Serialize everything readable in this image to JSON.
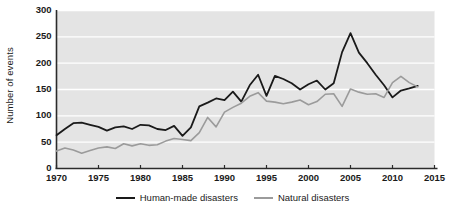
{
  "chart_data": {
    "type": "line",
    "title": "",
    "xlabel": "",
    "ylabel": "Number of events",
    "xlim": [
      1970,
      2015
    ],
    "ylim": [
      0,
      300
    ],
    "yticks": [
      0,
      50,
      100,
      150,
      200,
      250,
      300
    ],
    "xticks": [
      1970,
      1975,
      1980,
      1985,
      1990,
      1995,
      2000,
      2005,
      2010,
      2015
    ],
    "grid": "horizontal-white-on-gray",
    "legend_position": "below",
    "x": [
      1970,
      1971,
      1972,
      1973,
      1974,
      1975,
      1976,
      1977,
      1978,
      1979,
      1980,
      1981,
      1982,
      1983,
      1984,
      1985,
      1986,
      1987,
      1988,
      1989,
      1990,
      1991,
      1992,
      1993,
      1994,
      1995,
      1996,
      1997,
      1998,
      1999,
      2000,
      2001,
      2002,
      2003,
      2004,
      2005,
      2006,
      2007,
      2008,
      2009,
      2010,
      2011,
      2012,
      2013
    ],
    "series": [
      {
        "name": "Human-made disasters",
        "color": "#1a1a1a",
        "values": [
          63,
          75,
          86,
          87,
          83,
          79,
          72,
          78,
          80,
          75,
          83,
          82,
          75,
          73,
          81,
          62,
          78,
          118,
          125,
          133,
          130,
          146,
          127,
          158,
          178,
          138,
          176,
          170,
          162,
          150,
          160,
          167,
          150,
          162,
          221,
          257,
          220,
          200,
          178,
          158,
          135,
          148,
          152,
          157
        ]
      },
      {
        "name": "Natural disasters",
        "color": "#9b9b9b",
        "values": [
          33,
          39,
          35,
          29,
          34,
          39,
          41,
          38,
          47,
          43,
          47,
          44,
          45,
          52,
          57,
          55,
          53,
          68,
          97,
          79,
          107,
          116,
          124,
          137,
          144,
          128,
          126,
          123,
          126,
          130,
          121,
          127,
          141,
          142,
          118,
          151,
          145,
          141,
          142,
          135,
          163,
          175,
          163,
          155
        ]
      }
    ]
  },
  "axis": {
    "ylabel": "Number of events",
    "ytick_labels": [
      "300",
      "250",
      "200",
      "150",
      "100",
      "50",
      "0"
    ],
    "xtick_labels": [
      "1970",
      "1975",
      "1980",
      "1985",
      "1990",
      "1995",
      "2000",
      "2005",
      "2010",
      "2015"
    ]
  },
  "legend": {
    "items": [
      {
        "label": "Human-made disasters",
        "color": "#1a1a1a"
      },
      {
        "label": "Natural disasters",
        "color": "#9b9b9b"
      }
    ]
  },
  "colors": {
    "plot_background": "#e4e4e4",
    "gridline": "#ffffff",
    "axis": "#2b2b2b",
    "human_made": "#1a1a1a",
    "natural": "#9b9b9b"
  }
}
